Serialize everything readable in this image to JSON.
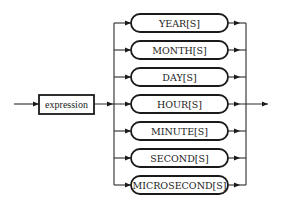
{
  "diagram": {
    "type": "syntax-railroad",
    "input": {
      "label": "expression"
    },
    "options": [
      {
        "label": "YEAR[S]"
      },
      {
        "label": "MONTH[S]"
      },
      {
        "label": "DAY[S]"
      },
      {
        "label": "HOUR[S]"
      },
      {
        "label": "MINUTE[S]"
      },
      {
        "label": "SECOND[S]"
      },
      {
        "label": "MICROSECOND[S]"
      }
    ],
    "colors": {
      "stroke": "#1a1a1a",
      "background": "#ffffff"
    }
  }
}
